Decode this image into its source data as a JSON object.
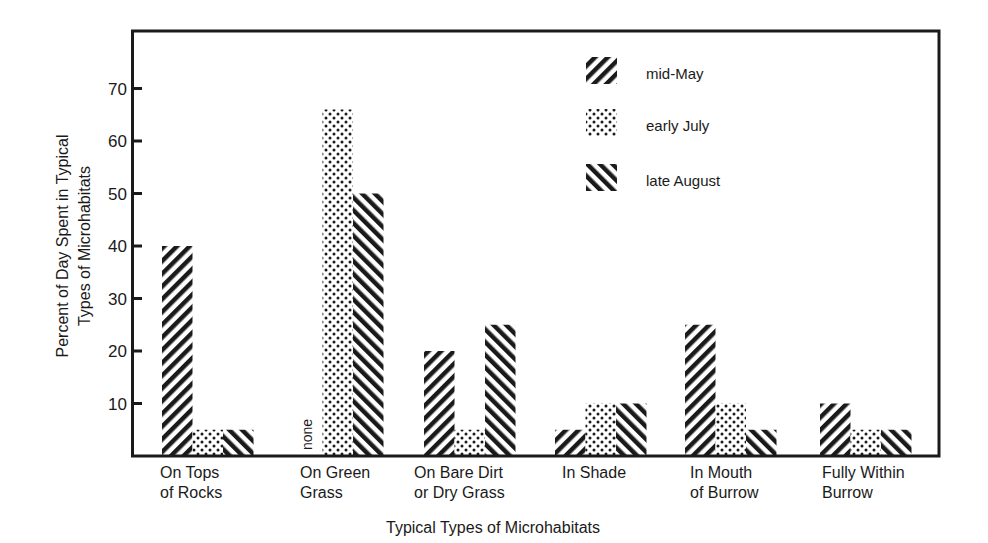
{
  "chart_data": {
    "type": "bar",
    "title": "",
    "xlabel": "Typical Types of Microhabitats",
    "ylabel_lines": [
      "Percent of Day Spent in Typical",
      "Types of Microhabitats"
    ],
    "ylabel": "Percent of Day Spent in Typical Types of Microhabitats",
    "ylim": [
      0,
      80
    ],
    "yticks": [
      10,
      20,
      30,
      40,
      50,
      60,
      70
    ],
    "grid": false,
    "legend_position": "upper right (inside plot)",
    "categories": [
      "On Tops of Rocks",
      "On Green Grass",
      "On Bare Dirt or Dry Grass",
      "In Shade",
      "In Mouth of Burrow",
      "Fully Within Burrow"
    ],
    "category_label_lines": [
      [
        "On Tops",
        "of Rocks"
      ],
      [
        "On Green",
        "Grass"
      ],
      [
        "On Bare Dirt",
        "or Dry Grass"
      ],
      [
        "In Shade"
      ],
      [
        "In Mouth",
        "of Burrow"
      ],
      [
        "Fully Within",
        "Burrow"
      ]
    ],
    "series": [
      {
        "name": "mid-May",
        "pattern": "back-diagonal-hatch",
        "values": [
          40,
          0,
          20,
          5,
          25,
          10
        ]
      },
      {
        "name": "early July",
        "pattern": "dots",
        "values": [
          5,
          66,
          5,
          10,
          10,
          5
        ]
      },
      {
        "name": "late August",
        "pattern": "forward-diagonal-hatch",
        "values": [
          5,
          50,
          25,
          10,
          5,
          5
        ]
      }
    ],
    "annotations": [
      {
        "text": "none",
        "category": "On Green Grass",
        "series": "mid-May",
        "orientation": "vertical"
      }
    ]
  },
  "colors": {
    "ink": "#1a1a1a",
    "background": "#ffffff"
  }
}
